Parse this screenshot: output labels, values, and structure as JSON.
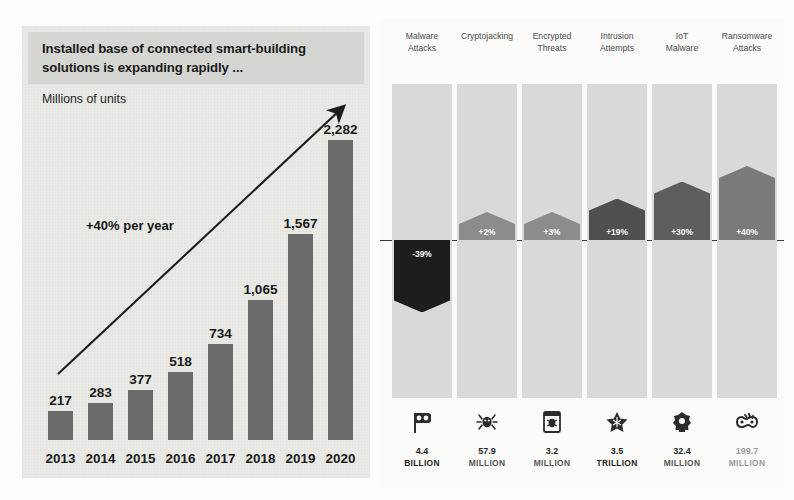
{
  "left": {
    "title": "Installed base of connected smart-building solutions is expanding rapidly ...",
    "subtitle": "Millions of units",
    "annotation": "+40% per year"
  },
  "right": {
    "zero_line": true
  },
  "chart_data": [
    {
      "type": "bar",
      "title": "Installed base of connected smart-building solutions is expanding rapidly ...",
      "subtitle": "Millions of units",
      "xlabel": "",
      "ylabel": "Millions of units",
      "annotation": "+40% per year",
      "categories": [
        "2013",
        "2014",
        "2015",
        "2016",
        "2017",
        "2018",
        "2019",
        "2020"
      ],
      "values": [
        217,
        283,
        377,
        518,
        734,
        1065,
        1567,
        2282
      ],
      "value_labels": [
        "217",
        "283",
        "377",
        "518",
        "734",
        "1,065",
        "1,567",
        "2,282"
      ],
      "ylim": [
        0,
        2282
      ],
      "grid": false,
      "legend": "none",
      "bar_color": "#6b6b6b",
      "panel_color": "#e9e9e6",
      "header_color": "#d5d5d2"
    },
    {
      "type": "bar",
      "title": "",
      "xlabel": "",
      "ylabel": "Year-over-year change",
      "grid": false,
      "legend": "none",
      "zero_line": 0,
      "ylim": [
        -39,
        40
      ],
      "categories": [
        "Malware\nAttacks",
        "Cryptojacking",
        "Encrypted\nThreats",
        "Intrusion\nAttempts",
        "IoT\nMalware",
        "Ransomware\nAttacks"
      ],
      "values": [
        -39,
        2,
        3,
        19,
        30,
        40
      ],
      "value_labels": [
        "-39%",
        "+2%",
        "+3%",
        "+19%",
        "+30%",
        "+40%"
      ],
      "bar_colors": [
        "#1d1d1d",
        "#8c8c8c",
        "#8c8c8c",
        "#4f4f4f",
        "#5e5e5e",
        "#7a7a7a"
      ],
      "band_color": "#d9d9d7",
      "annotations": [
        {
          "value": "4.4",
          "unit": "BILLION",
          "icon": "malware-flag-icon"
        },
        {
          "value": "57.9",
          "unit": "MILLION",
          "icon": "spider-bug-icon"
        },
        {
          "value": "3.2",
          "unit": "MILLION",
          "icon": "document-bug-icon"
        },
        {
          "value": "3.5",
          "unit": "TRILLION",
          "icon": "star-badge-icon"
        },
        {
          "value": "32.4",
          "unit": "MILLION",
          "icon": "iot-device-icon"
        },
        {
          "value": "199.7",
          "unit": "MILLION",
          "icon": "ransomware-lock-icon"
        }
      ]
    }
  ]
}
